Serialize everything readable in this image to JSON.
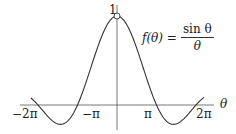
{
  "chart_data": {
    "type": "line",
    "title": "",
    "function_label": {
      "lhs": "f(θ) =",
      "numerator": "sin θ",
      "denominator": "θ"
    },
    "xlabel": "θ",
    "ylabel": "",
    "x_ticks": [
      {
        "value": -6.2832,
        "label": "−2π"
      },
      {
        "value": -3.1416,
        "label": "−π"
      },
      {
        "value": 3.1416,
        "label": "π"
      },
      {
        "value": 6.2832,
        "label": "2π"
      }
    ],
    "y_ticks": [
      {
        "value": 1,
        "label": "1"
      }
    ],
    "xlim": [
      -6.9,
      6.9
    ],
    "ylim": [
      -0.22,
      1
    ],
    "grid": false,
    "legend": null,
    "series": [
      {
        "name": "sin θ / θ",
        "x": [
          -6.9,
          -6.2832,
          -5.5,
          -4.4934,
          -3.5,
          -3.1416,
          -2.5,
          -2.0,
          -1.5,
          -1.0,
          -0.5,
          0,
          0.5,
          1.0,
          1.5,
          2.0,
          2.5,
          3.1416,
          3.5,
          4.4934,
          5.5,
          6.2832,
          6.9
        ],
        "values": [
          0.083,
          0.0,
          -0.128,
          -0.217,
          -0.1,
          0.0,
          0.239,
          0.455,
          0.665,
          0.841,
          0.959,
          1.0,
          0.959,
          0.841,
          0.665,
          0.455,
          0.239,
          0.0,
          -0.1,
          -0.217,
          -0.128,
          0.0,
          0.083
        ]
      }
    ],
    "annotations": [
      {
        "type": "open-circle",
        "x": 0,
        "y": 1,
        "note": "removable discontinuity at θ=0"
      }
    ]
  },
  "colors": {
    "curve": "#333333",
    "axis": "#555555",
    "text": "#222222",
    "background": "#ffffff"
  }
}
